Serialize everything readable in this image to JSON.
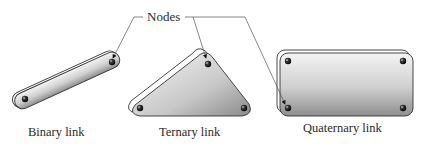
{
  "diagram": {
    "callout": {
      "label": "Nodes",
      "targets": [
        "binary-link-node",
        "ternary-link-node",
        "quaternary-link-node"
      ]
    },
    "links": [
      {
        "id": "binary",
        "label": "Binary link",
        "node_count": 2
      },
      {
        "id": "ternary",
        "label": "Ternary link",
        "node_count": 3
      },
      {
        "id": "quaternary",
        "label": "Quaternary link",
        "node_count": 4
      }
    ],
    "colors": {
      "link_fill_light": "#f2f2f2",
      "link_fill_dark": "#9a9a9a",
      "outline": "#333333",
      "leader_line": "#555555",
      "node": "#111111"
    }
  }
}
